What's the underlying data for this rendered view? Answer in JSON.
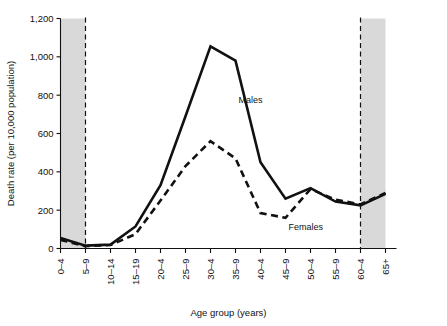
{
  "chart_data": {
    "type": "line",
    "title": "",
    "xlabel": "Age group (years)",
    "ylabel": "Death rate (per 10,000 population)",
    "categories": [
      "0–4",
      "5–9",
      "10–14",
      "15–19",
      "20–4",
      "25–9",
      "30–4",
      "35–9",
      "40–4",
      "45–9",
      "50–4",
      "55–9",
      "60–4",
      "65+"
    ],
    "series": [
      {
        "name": "Males",
        "style": "solid",
        "values": [
          55,
          15,
          20,
          115,
          330,
          690,
          1055,
          980,
          450,
          260,
          315,
          245,
          225,
          285
        ]
      },
      {
        "name": "Females",
        "style": "dashed",
        "values": [
          45,
          12,
          18,
          75,
          250,
          430,
          560,
          470,
          185,
          160,
          310,
          255,
          230,
          290
        ]
      }
    ],
    "ylim": [
      0,
      1200
    ],
    "yticks": [
      0,
      200,
      400,
      600,
      800,
      1000,
      1200
    ],
    "ytick_labels": [
      "0",
      "200",
      "400",
      "600",
      "800",
      "1,000",
      "1,200"
    ],
    "grid": false,
    "legend_position": "inline-annotations",
    "annotations": [
      {
        "text": "Males",
        "category": "35–9",
        "value": 760
      },
      {
        "text": "Females",
        "category": "45–9",
        "value": 95
      }
    ],
    "shaded_bands": [
      {
        "from_category": "0–4",
        "to_category": "5–9",
        "color": "#d9d9d9"
      },
      {
        "from_category": "60–4",
        "to_category": "65+",
        "color": "#d9d9d9"
      }
    ],
    "divider_lines": [
      "5–9",
      "60–4"
    ],
    "colors": {
      "line": "#111111",
      "band": "#d9d9d9",
      "axis": "#111111"
    }
  }
}
